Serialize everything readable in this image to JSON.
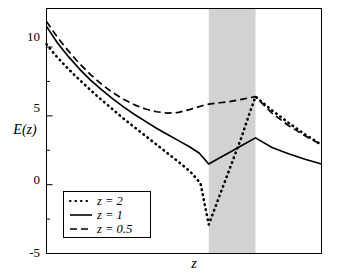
{
  "chart_data": {
    "type": "line",
    "title": "",
    "xlabel": "z",
    "ylabel": "E(z)",
    "xlim": [
      0,
      10
    ],
    "ylim": [
      -5,
      12.8
    ],
    "grid": false,
    "yticks": [
      -5,
      0,
      5,
      10
    ],
    "yticklabels": [
      "-5",
      "0",
      "5",
      "10"
    ],
    "yminorticks": [
      -2.5,
      2.5,
      7.5
    ],
    "xticklabels": [],
    "legend_position": "lower left",
    "shaded_band": {
      "label": "",
      "x_start": 5.9,
      "x_end": 7.6,
      "color": "#d2d2d2"
    },
    "series": [
      {
        "name": "z = 2",
        "style": "dotted",
        "color": "#000000",
        "points": [
          [
            0.0,
            10.2
          ],
          [
            0.35,
            9.35
          ],
          [
            0.7,
            8.6
          ],
          [
            1.05,
            7.9
          ],
          [
            1.4,
            7.25
          ],
          [
            1.75,
            6.6
          ],
          [
            2.1,
            6.0
          ],
          [
            2.45,
            5.4
          ],
          [
            2.8,
            4.8
          ],
          [
            3.15,
            4.25
          ],
          [
            3.5,
            3.7
          ],
          [
            3.85,
            3.15
          ],
          [
            4.2,
            2.6
          ],
          [
            4.55,
            2.05
          ],
          [
            4.9,
            1.5
          ],
          [
            5.25,
            0.9
          ],
          [
            5.6,
            0.1
          ],
          [
            5.9,
            -2.9
          ],
          [
            6.2,
            -1.3
          ],
          [
            6.5,
            0.3
          ],
          [
            6.8,
            1.9
          ],
          [
            7.1,
            3.5
          ],
          [
            7.35,
            5.0
          ],
          [
            7.6,
            6.4
          ],
          [
            8.2,
            5.4
          ],
          [
            8.8,
            4.5
          ],
          [
            9.4,
            3.65
          ],
          [
            10.0,
            2.9
          ]
        ]
      },
      {
        "name": "z = 1",
        "style": "solid",
        "color": "#000000",
        "points": [
          [
            0.0,
            11.5
          ],
          [
            0.4,
            10.3
          ],
          [
            0.8,
            9.3
          ],
          [
            1.2,
            8.4
          ],
          [
            1.6,
            7.6
          ],
          [
            2.0,
            6.9
          ],
          [
            2.4,
            6.25
          ],
          [
            2.8,
            5.65
          ],
          [
            3.2,
            5.1
          ],
          [
            3.6,
            4.6
          ],
          [
            4.0,
            4.1
          ],
          [
            4.4,
            3.65
          ],
          [
            4.8,
            3.2
          ],
          [
            5.2,
            2.75
          ],
          [
            5.55,
            2.3
          ],
          [
            5.9,
            1.5
          ],
          [
            6.3,
            1.95
          ],
          [
            6.7,
            2.4
          ],
          [
            7.1,
            2.85
          ],
          [
            7.6,
            3.4
          ],
          [
            8.2,
            2.7
          ],
          [
            8.8,
            2.25
          ],
          [
            9.4,
            1.85
          ],
          [
            10.0,
            1.5
          ]
        ]
      },
      {
        "name": "z = 0.5",
        "style": "dashed",
        "color": "#000000",
        "points": [
          [
            0.0,
            11.85
          ],
          [
            0.4,
            10.7
          ],
          [
            0.8,
            9.7
          ],
          [
            1.2,
            8.8
          ],
          [
            1.6,
            8.0
          ],
          [
            2.0,
            7.3
          ],
          [
            2.4,
            6.7
          ],
          [
            2.8,
            6.2
          ],
          [
            3.2,
            5.8
          ],
          [
            3.6,
            5.5
          ],
          [
            4.0,
            5.3
          ],
          [
            4.4,
            5.2
          ],
          [
            4.8,
            5.25
          ],
          [
            5.2,
            5.45
          ],
          [
            5.6,
            5.7
          ],
          [
            5.9,
            5.85
          ],
          [
            6.3,
            5.95
          ],
          [
            6.7,
            6.05
          ],
          [
            7.1,
            6.2
          ],
          [
            7.6,
            6.4
          ],
          [
            8.2,
            5.2
          ],
          [
            8.8,
            4.3
          ],
          [
            9.4,
            3.55
          ],
          [
            10.0,
            2.9
          ]
        ]
      }
    ]
  },
  "legend": {
    "items": [
      {
        "label": "z = 2",
        "style": "dotted"
      },
      {
        "label": "z = 1",
        "style": "solid"
      },
      {
        "label": "z = 0.5",
        "style": "dashed"
      }
    ]
  },
  "axes": {
    "ylabel": "E(z)",
    "xlabel": "z",
    "ytick_10": "10",
    "ytick_5": "5",
    "ytick_0": "0",
    "ytick_neg5": "-5"
  }
}
